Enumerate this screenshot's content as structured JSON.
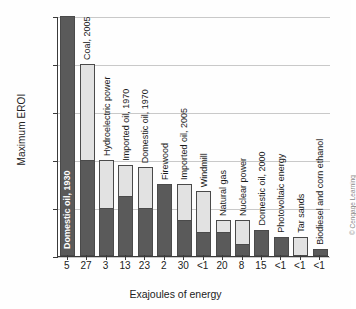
{
  "chart_data": {
    "type": "bar",
    "title": "",
    "xlabel": "Exajoules of energy",
    "ylabel": "Maximum EROI",
    "ylim": [
      0,
      100
    ],
    "yticks": [
      "0:1",
      "20:1",
      "40:1",
      "60:1",
      "80:1",
      "100:1"
    ],
    "ytick_values": [
      0,
      20,
      40,
      60,
      80,
      100
    ],
    "grid": true,
    "legend": null,
    "stacked": true,
    "categories": [
      "Domestic oil, 1930",
      "Coal, 2005",
      "Hydroelectric power",
      "Imported oil, 1970",
      "Domestic oil, 1970",
      "Firewood",
      "Imported oil, 2005",
      "Windmill",
      "Natural gas",
      "Nuclear power",
      "Domestic oil, 2000",
      "Photovoltaic energy",
      "Tar sands",
      "Biodiesel and corn ethanol"
    ],
    "xtick_labels": [
      "5",
      "27",
      "3",
      "13",
      "23",
      "2",
      "30",
      "<1",
      "20",
      "8",
      "15",
      "<1",
      "<1",
      "<1"
    ],
    "series": [
      {
        "name": "lower (dark) value",
        "values": [
          100,
          40,
          20,
          25,
          20,
          30,
          15,
          10,
          10,
          5,
          11,
          8,
          0,
          3
        ]
      },
      {
        "name": "upper (maximum) value",
        "values": [
          100,
          80,
          40,
          38,
          37,
          30,
          30,
          27,
          15,
          15,
          11,
          8,
          8,
          3
        ]
      }
    ],
    "colors": {
      "dark_bar": "#5a5a5a",
      "light_bar": "#e2e2e2",
      "bar_outline": "#4a4a4a",
      "gridline": "#c9c9c9",
      "axis": "#3a3a3a",
      "text": "#1a1a1a",
      "credit_text": "#8a8a8a"
    },
    "label_inside_bar": [
      true,
      false,
      false,
      false,
      false,
      false,
      false,
      false,
      false,
      false,
      false,
      false,
      false,
      false
    ]
  },
  "credit": "© Cengage Learning"
}
